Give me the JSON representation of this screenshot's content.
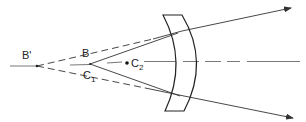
{
  "diagram": {
    "type": "optics-ray-diagram",
    "labels": {
      "b_prime": "B'",
      "b": "B",
      "b_mark": "-",
      "c1_letter": "C",
      "c1_sub": "1",
      "c2_letter": "C",
      "c2_sub": "2"
    },
    "colors": {
      "line": "#333333",
      "background": "#ffffff"
    }
  }
}
